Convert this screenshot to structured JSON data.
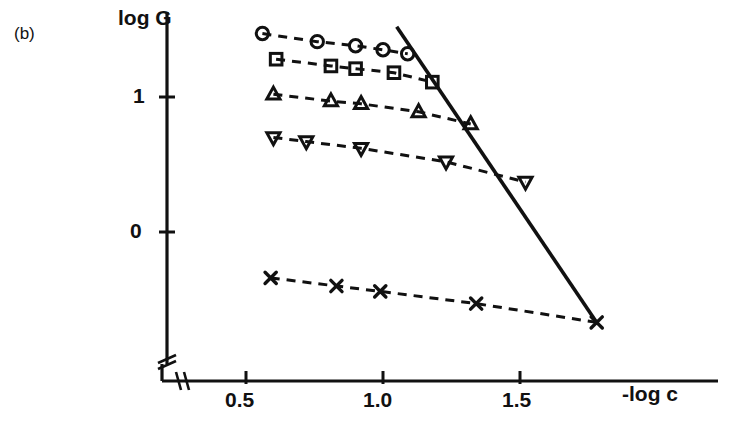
{
  "figure": {
    "panel_label": "(b)",
    "background": "#ffffff",
    "ink_color": "#111111"
  },
  "chart_data": {
    "type": "scatter",
    "title": "",
    "subtitle": "",
    "panel": "(b)",
    "xlabel": "-log c",
    "ylabel": "log G",
    "xticks": [
      0.5,
      1.0,
      1.5
    ],
    "xtick_labels": [
      "0.5",
      "1.0",
      "1.5"
    ],
    "yticks": [
      0,
      1
    ],
    "ytick_labels": [
      "0",
      "1"
    ],
    "xlim": [
      0.28,
      1.76
    ],
    "ylim": [
      -0.85,
      1.72
    ],
    "grid": false,
    "legend": null,
    "axis_break_x": true,
    "axis_break_y": true,
    "series": [
      {
        "name": "circles",
        "marker": "circle",
        "linestyle": "dashed",
        "x": [
          0.56,
          0.76,
          0.9,
          1.0,
          1.09
        ],
        "y": [
          1.47,
          1.41,
          1.38,
          1.35,
          1.32
        ]
      },
      {
        "name": "squares",
        "marker": "square",
        "linestyle": "dashed",
        "x": [
          0.61,
          0.81,
          0.9,
          1.04,
          1.18
        ],
        "y": [
          1.28,
          1.23,
          1.21,
          1.18,
          1.11
        ]
      },
      {
        "name": "triangles-up",
        "marker": "triangle-up",
        "linestyle": "dashed",
        "x": [
          0.6,
          0.81,
          0.92,
          1.13,
          1.32
        ],
        "y": [
          1.02,
          0.97,
          0.95,
          0.89,
          0.8
        ]
      },
      {
        "name": "triangles-down",
        "marker": "triangle-down",
        "linestyle": "dashed",
        "x": [
          0.6,
          0.72,
          0.92,
          1.23,
          1.52
        ],
        "y": [
          0.7,
          0.67,
          0.62,
          0.52,
          0.37
        ]
      },
      {
        "name": "crosses",
        "marker": "x",
        "linestyle": "dashed",
        "x": [
          0.59,
          0.83,
          0.99,
          1.34,
          1.78
        ],
        "y": [
          -0.34,
          -0.4,
          -0.44,
          -0.53,
          -0.67
        ]
      },
      {
        "name": "envelope",
        "marker": "none",
        "linestyle": "solid",
        "x": [
          1.05,
          1.78
        ],
        "y": [
          1.52,
          -0.67
        ]
      }
    ]
  },
  "axes": {
    "y_axis_title": "log G",
    "x_axis_title": "-log c",
    "ytick_1": "1",
    "ytick_0": "0",
    "xtick_05": "0.5",
    "xtick_10": "1.0",
    "xtick_15": "1.5"
  }
}
